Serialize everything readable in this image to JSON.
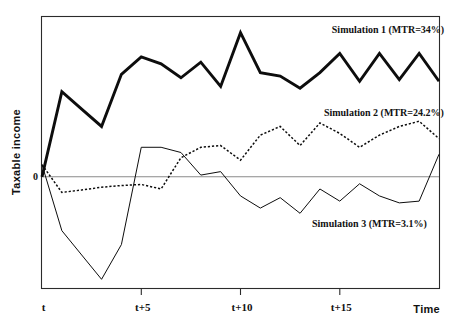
{
  "chart_data": {
    "type": "line",
    "title": "",
    "xlabel": "Time",
    "ylabel": "Taxable income",
    "grid": false,
    "legend_position": "inline-annotations",
    "zero_reference_label": "0",
    "xlim": [
      0,
      20
    ],
    "ylim": [
      -3.2,
      4.6
    ],
    "xticks": [
      {
        "value": 0,
        "label": "t"
      },
      {
        "value": 5,
        "label": "t+5"
      },
      {
        "value": 10,
        "label": "t+10"
      },
      {
        "value": 15,
        "label": "t+15"
      }
    ],
    "yticks": [
      {
        "value": 0,
        "label": "0"
      }
    ],
    "x": [
      0,
      1,
      2,
      3,
      4,
      5,
      6,
      7,
      8,
      9,
      10,
      11,
      12,
      13,
      14,
      15,
      16,
      17,
      18,
      19,
      20
    ],
    "series": [
      {
        "name": "Simulation 1 (MTR=34%)",
        "style": "solid-thick",
        "annotation": "Simulation 1 (MTR=34%)",
        "annotation_x": 14.6,
        "annotation_y": 4.15,
        "values": [
          0.0,
          2.45,
          1.95,
          1.45,
          2.95,
          3.45,
          3.25,
          2.85,
          3.3,
          2.6,
          4.15,
          3.0,
          2.9,
          2.55,
          3.0,
          3.55,
          2.75,
          3.55,
          2.8,
          3.55,
          2.75
        ]
      },
      {
        "name": "Simulation 2 (MTR=24.2%)",
        "style": "dotted",
        "annotation": "Simulation 2  (MTR=24.2%)",
        "annotation_x": 14.2,
        "annotation_y": 1.75,
        "values": [
          0.35,
          -0.45,
          -0.38,
          -0.3,
          -0.25,
          -0.22,
          -0.35,
          0.55,
          0.85,
          0.9,
          0.48,
          1.2,
          1.45,
          0.9,
          1.55,
          1.25,
          0.85,
          1.2,
          1.45,
          1.6,
          1.1
        ]
      },
      {
        "name": "Simulation 3 (MTR=3.1%)",
        "style": "solid-thin",
        "annotation": "Simulation 3  (MTR=3.1%)",
        "annotation_x": 13.6,
        "annotation_y": -1.45,
        "values": [
          0.35,
          -1.55,
          -2.25,
          -2.95,
          -1.95,
          0.85,
          0.85,
          0.7,
          0.05,
          0.15,
          -0.55,
          -0.9,
          -0.6,
          -1.05,
          -0.35,
          -0.7,
          -0.2,
          -0.55,
          -0.75,
          -0.7,
          0.65
        ]
      }
    ]
  },
  "axis": {
    "y_title": "Taxable income",
    "x_title": "Time",
    "zero_label": "0"
  }
}
